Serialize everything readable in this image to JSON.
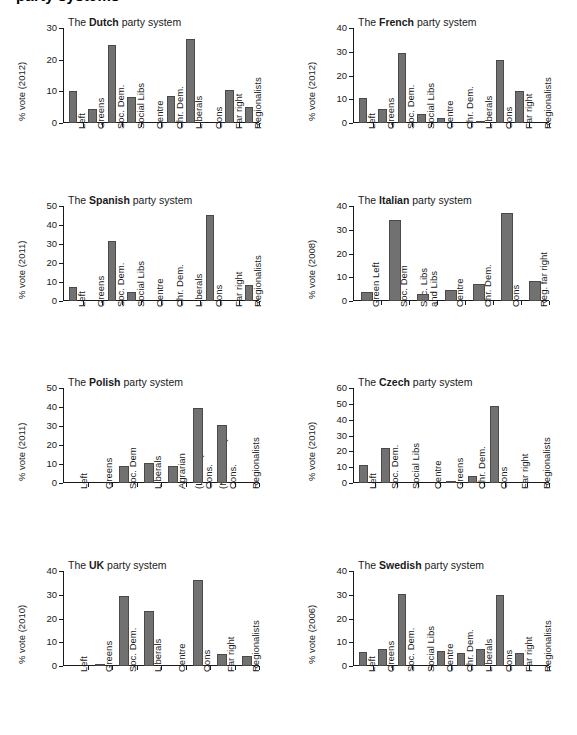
{
  "page": {
    "clipped_top_title": "party systems",
    "bar_color": "#717171",
    "bar_border_color": "#4a4a4a",
    "axis_color": "#1a1a1a",
    "background": "#ffffff"
  },
  "chart_data": [
    {
      "id": "dutch",
      "type": "bar",
      "title_prefix": "The ",
      "title_country": "Dutch",
      "title_suffix": " party system",
      "title": "The Dutch party system",
      "ylabel": "% vote (2012)",
      "xlabel": "",
      "ylim": [
        0,
        30
      ],
      "yticks": [
        0,
        10,
        20,
        30
      ],
      "grid": false,
      "categories": [
        "Left",
        "Greens",
        "Soc. Dem.",
        "Social Libs",
        "Centre",
        "Chr. Dem.",
        "Liberals",
        "Cons",
        "Far right",
        "Regionalists"
      ],
      "values": [
        10.2,
        4.4,
        24.7,
        8.2,
        0,
        8.6,
        26.5,
        0,
        10.3,
        5.2
      ]
    },
    {
      "id": "french",
      "type": "bar",
      "title_prefix": "The ",
      "title_country": "French",
      "title_suffix": " party system",
      "title": "The French party system",
      "ylabel": "% vote (2012)",
      "xlabel": "",
      "ylim": [
        0,
        40
      ],
      "yticks": [
        0,
        10,
        20,
        30,
        40
      ],
      "grid": false,
      "categories": [
        "Left",
        "Greens",
        "Soc. Dem.",
        "Social Libs",
        "Centre",
        "Chr. Dem.",
        "Liberals",
        "Cons",
        "Far right",
        "Regionalists"
      ],
      "values": [
        10.5,
        5.7,
        29.4,
        3.7,
        2.2,
        0,
        1.0,
        26.6,
        13.3,
        0
      ]
    },
    {
      "id": "spanish",
      "type": "bar",
      "title_prefix": "The ",
      "title_country": "Spanish",
      "title_suffix": " party system",
      "title": "The Spanish party system",
      "ylabel": "% vote (2011)",
      "xlabel": "",
      "ylim": [
        0,
        50
      ],
      "yticks": [
        0,
        10,
        20,
        30,
        40,
        50
      ],
      "grid": false,
      "categories": [
        "Left",
        "Greens",
        "Soc. Dem.",
        "Social Libs",
        "Centre",
        "Chr. Dem.",
        "Liberals",
        "Cons",
        "Far right",
        "Regionalists"
      ],
      "values": [
        7.2,
        0,
        31.5,
        5.0,
        0,
        0,
        0,
        45.4,
        0,
        8.5
      ]
    },
    {
      "id": "italian",
      "type": "bar",
      "title_prefix": "The ",
      "title_country": "Italian",
      "title_suffix": " party system",
      "title": "The Italian party system",
      "ylabel": "% vote (2008)",
      "xlabel": "",
      "ylim": [
        0,
        40
      ],
      "yticks": [
        0,
        10,
        20,
        30,
        40
      ],
      "grid": false,
      "categories": [
        "Green Left",
        "Soc. Dem",
        "Soc. Libs\nand Libs",
        "Centre",
        "Chr. Dem.",
        "Cons",
        "Reg. far right"
      ],
      "values": [
        3.7,
        34.3,
        3.1,
        4.8,
        7.0,
        37.2,
        8.3
      ]
    },
    {
      "id": "polish",
      "type": "bar",
      "title_prefix": "The ",
      "title_country": "Polish",
      "title_suffix": " party system",
      "title": "The Polish party system",
      "ylabel": "% vote (2011)",
      "xlabel": "",
      "ylim": [
        0,
        50
      ],
      "yticks": [
        0,
        10,
        20,
        30,
        40,
        50
      ],
      "grid": false,
      "categories": [
        "Left",
        "Greens",
        "Soc. Dem",
        "Liberals",
        "Agrarian",
        "(Liberal)\nCons.",
        "(Nationalist)\nCons.",
        "Regionalists"
      ],
      "values": [
        0,
        0,
        8.7,
        10.5,
        9.0,
        39.5,
        30.5,
        0
      ]
    },
    {
      "id": "czech",
      "type": "bar",
      "title_prefix": "The ",
      "title_country": "Czech",
      "title_suffix": " party system",
      "title": "The Czech party system",
      "ylabel": "% vote (2010)",
      "xlabel": "",
      "ylim": [
        0,
        60
      ],
      "yticks": [
        0,
        10,
        20,
        30,
        40,
        50,
        60
      ],
      "grid": false,
      "categories": [
        "Left",
        "Soc. Dem.",
        "Social Libs",
        "Centre",
        "Greens",
        "Chr. Dem.",
        "Cons",
        "Far right",
        "Regionalists"
      ],
      "values": [
        11.3,
        22.1,
        0,
        0,
        1.3,
        4.4,
        48.5,
        0,
        0
      ]
    },
    {
      "id": "uk",
      "type": "bar",
      "title_prefix": "The ",
      "title_country": "UK",
      "title_suffix": " party system",
      "title": "The UK party system",
      "ylabel": "% vote (2010)",
      "xlabel": "",
      "ylim": [
        0,
        40
      ],
      "yticks": [
        0,
        10,
        20,
        30,
        40
      ],
      "grid": false,
      "categories": [
        "Left",
        "Greens",
        "Soc. Dem.",
        "Liberals",
        "Centre",
        "Cons",
        "Far right",
        "Regionalists"
      ],
      "values": [
        0,
        1.0,
        29.5,
        23.3,
        0,
        36.3,
        5.0,
        4.3
      ]
    },
    {
      "id": "swedish",
      "type": "bar",
      "title_prefix": "The ",
      "title_country": "Swedish",
      "title_suffix": " party system",
      "title": "The Swedish party system",
      "ylabel": "% vote (2006)",
      "xlabel": "",
      "ylim": [
        0,
        40
      ],
      "yticks": [
        0,
        10,
        20,
        30,
        40
      ],
      "grid": false,
      "categories": [
        "Left",
        "Greens",
        "Soc. Dem.",
        "Social Libs",
        "Centre",
        "Chr. Dem.",
        "Liberals",
        "Cons",
        "Far right",
        "Regionalists"
      ],
      "values": [
        5.8,
        7.3,
        30.5,
        0,
        6.3,
        5.5,
        7.0,
        29.9,
        5.4,
        0
      ]
    }
  ]
}
